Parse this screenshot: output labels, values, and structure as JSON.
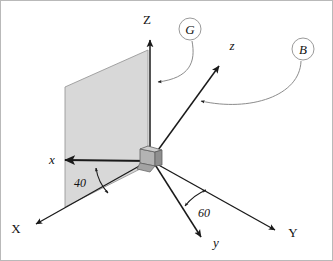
{
  "figure": {
    "type": "coordinate-frame-diagram",
    "caption": "",
    "background_color": "#ffffff",
    "border_color": "#b9b9b9"
  },
  "colors": {
    "axis_line": "#1a1a1a",
    "plane_fill": "#d8d8d8",
    "plane_stroke": "#9a9a9a",
    "joint_fill_light": "#cdcdcd",
    "joint_fill_mid": "#b3b3b3",
    "joint_fill_dark": "#8f8f8f",
    "joint_stroke": "#5f5f5f",
    "leader_line": "#8c8c8c",
    "callout_circle_stroke": "#9a9a9a",
    "text": "#111111"
  },
  "axes": {
    "global": [
      {
        "id": "axis-X",
        "label": "X",
        "style": "upper",
        "tip": {
          "x": 33,
          "y": 226
        }
      },
      {
        "id": "axis-Y",
        "label": "Y",
        "style": "upper",
        "tip": {
          "x": 278,
          "y": 232
        }
      },
      {
        "id": "axis-Z",
        "label": "Z",
        "style": "upper",
        "tip": {
          "x": 150,
          "y": 37
        }
      }
    ],
    "body": [
      {
        "id": "axis-x",
        "label": "x",
        "style": "italic",
        "tip": {
          "x": 62,
          "y": 160
        }
      },
      {
        "id": "axis-y",
        "label": "y",
        "style": "italic",
        "tip": {
          "x": 203,
          "y": 240
        }
      },
      {
        "id": "axis-z",
        "label": "z",
        "style": "italic",
        "tip": {
          "x": 222,
          "y": 63
        }
      }
    ],
    "origin": {
      "x": 152,
      "y": 158
    }
  },
  "angles": [
    {
      "id": "angle-40",
      "value": "40",
      "unit": "deg",
      "between": [
        "x",
        "X"
      ],
      "label_pos": {
        "x": 80,
        "y": 183
      }
    },
    {
      "id": "angle-60",
      "value": "60",
      "unit": "deg",
      "between": [
        "y",
        "Y"
      ],
      "label_pos": {
        "x": 203,
        "y": 213
      }
    }
  ],
  "callouts": [
    {
      "id": "callout-G",
      "label": "G",
      "circle": {
        "cx": 190,
        "cy": 29,
        "r": 11
      },
      "points_to": "Z-axis-plane"
    },
    {
      "id": "callout-B",
      "label": "B",
      "circle": {
        "cx": 303,
        "cy": 49,
        "r": 11
      },
      "points_to": "z-axis"
    }
  ],
  "plane": {
    "id": "reference-plane",
    "description": "shaded vertical plane containing Z and x axes",
    "corners": [
      {
        "x": 65,
        "y": 87
      },
      {
        "x": 148,
        "y": 50
      },
      {
        "x": 148,
        "y": 165
      },
      {
        "x": 65,
        "y": 207
      }
    ]
  },
  "joint": {
    "id": "origin-joint",
    "description": "small shaded 3D block at the common origin"
  }
}
